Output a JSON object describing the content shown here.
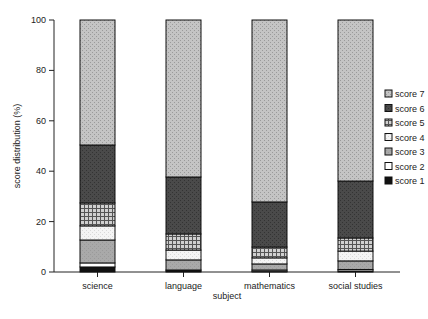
{
  "chart_data": {
    "type": "bar",
    "stacked": true,
    "title": "",
    "xlabel": "subject",
    "ylabel": "score distribution (%)",
    "ylim": [
      0,
      100
    ],
    "yticks": [
      0,
      20,
      40,
      60,
      80,
      100
    ],
    "grid": false,
    "legend_position": "right",
    "categories": [
      "science",
      "language",
      "mathematics",
      "social studies"
    ],
    "series": [
      {
        "name": "score 1",
        "color": "#111111",
        "pattern": "solid",
        "values": [
          2.0,
          0.4,
          0.3,
          0.4
        ]
      },
      {
        "name": "score 2",
        "color": "#ffffff",
        "pattern": "solid",
        "values": [
          1.6,
          0.4,
          0.5,
          0.6
        ]
      },
      {
        "name": "score 3",
        "color": "#a9a9a9",
        "pattern": "dots",
        "values": [
          9.1,
          4.0,
          2.4,
          3.4
        ]
      },
      {
        "name": "score 4",
        "color": "#f4f4f4",
        "pattern": "dots",
        "values": [
          5.6,
          3.9,
          2.4,
          3.9
        ]
      },
      {
        "name": "score 5",
        "color": "#8a8a8a",
        "pattern": "grid",
        "values": [
          9.1,
          6.4,
          4.3,
          5.2
        ]
      },
      {
        "name": "score 6",
        "color": "#4a4a4a",
        "pattern": "dots",
        "values": [
          23.0,
          22.6,
          17.9,
          22.6
        ]
      },
      {
        "name": "score 7",
        "color": "#c4c4c4",
        "pattern": "dots",
        "values": [
          49.6,
          62.3,
          72.2,
          63.9
        ]
      }
    ]
  }
}
